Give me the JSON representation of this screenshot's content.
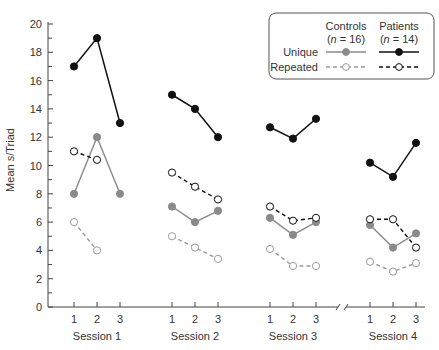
{
  "chart_data": {
    "type": "line",
    "title": "",
    "xlabel": "",
    "ylabel": "Mean s/Triad",
    "ylabel_parts": {
      "pre": "Mean ",
      "italic": "s",
      "post": "/Triad"
    },
    "ylim": [
      0,
      20
    ],
    "yticks": [
      0,
      2,
      4,
      6,
      8,
      10,
      12,
      14,
      16,
      18,
      20
    ],
    "grid": false,
    "legend_position": "top-right",
    "axis_break_between": [
      "Session 3",
      "Session 4"
    ],
    "groups": [
      {
        "name": "Session 1",
        "categories": [
          "1",
          "2",
          "3"
        ]
      },
      {
        "name": "Session 2",
        "categories": [
          "1",
          "2",
          "3"
        ]
      },
      {
        "name": "Session 3",
        "categories": [
          "1",
          "2",
          "3"
        ]
      },
      {
        "name": "Session 4",
        "categories": [
          "1",
          "2",
          "3"
        ]
      }
    ],
    "legend": {
      "columns": [
        {
          "name": "Controls",
          "n_label": "(n = 16)",
          "n_italic": "n",
          "n_rest": " = 16)"
        },
        {
          "name": "Patients",
          "n_label": "(n = 14)",
          "n_italic": "n",
          "n_rest": " = 14)"
        }
      ],
      "rows": [
        "Unique",
        "Repeated"
      ]
    },
    "series": [
      {
        "name": "Controls Unique",
        "group": "Controls",
        "condition": "Unique",
        "color": "#8a8a8a",
        "marker": "filled",
        "dash": false,
        "values": [
          [
            8.0,
            12.0,
            8.0
          ],
          [
            7.1,
            6.0,
            6.8
          ],
          [
            6.3,
            5.1,
            6.0
          ],
          [
            5.8,
            4.2,
            5.2
          ]
        ]
      },
      {
        "name": "Controls Repeated",
        "group": "Controls",
        "condition": "Repeated",
        "color": "#9a9a9a",
        "marker": "open",
        "dash": true,
        "values": [
          [
            6.0,
            4.0,
            null
          ],
          [
            5.0,
            4.2,
            3.4
          ],
          [
            4.1,
            2.9,
            2.9
          ],
          [
            3.2,
            2.5,
            3.1
          ]
        ]
      },
      {
        "name": "Patients Unique",
        "group": "Patients",
        "condition": "Unique",
        "color": "#111111",
        "marker": "filled",
        "dash": false,
        "values": [
          [
            17.0,
            19.0,
            13.0
          ],
          [
            15.0,
            14.0,
            12.0
          ],
          [
            12.7,
            11.9,
            13.3
          ],
          [
            10.2,
            9.2,
            11.6
          ]
        ]
      },
      {
        "name": "Patients Repeated",
        "group": "Patients",
        "condition": "Repeated",
        "color": "#111111",
        "marker": "open",
        "dash": true,
        "values": [
          [
            11.0,
            10.4,
            null
          ],
          [
            9.5,
            8.5,
            7.6
          ],
          [
            7.1,
            6.1,
            6.3
          ],
          [
            6.2,
            6.2,
            4.2
          ]
        ]
      }
    ]
  }
}
